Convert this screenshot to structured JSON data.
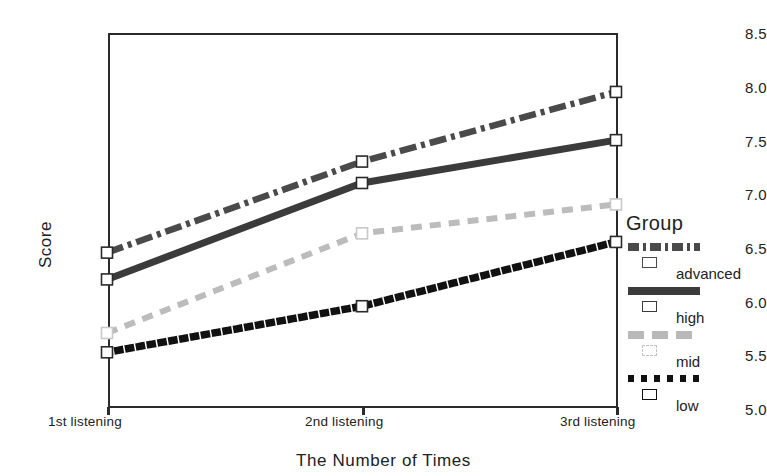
{
  "chart_data": {
    "type": "line",
    "title": "",
    "xlabel": "The Number of Times",
    "ylabel": "Score",
    "categories": [
      "1st listening",
      "2nd listening",
      "3rd listening"
    ],
    "ylim": [
      5.0,
      8.5
    ],
    "yticks": [
      "5.0",
      "5.5",
      "6.0",
      "6.5",
      "7.0",
      "7.5",
      "8.0",
      "8.5"
    ],
    "ytick_values": [
      5.0,
      5.5,
      6.0,
      6.5,
      7.0,
      7.5,
      8.0,
      8.5
    ],
    "grid": false,
    "legend_position": "right",
    "legend_title": "Group",
    "series": [
      {
        "name": "advanced",
        "values": [
          6.45,
          7.3,
          7.95
        ],
        "color": "#4a4a4a",
        "style": "dash-dot",
        "marker": "open-square"
      },
      {
        "name": "high",
        "values": [
          6.2,
          7.1,
          7.5
        ],
        "color": "#3b3b3b",
        "style": "solid",
        "marker": "open-square"
      },
      {
        "name": "mid",
        "values": [
          5.7,
          6.63,
          6.9
        ],
        "color": "#bcbcbc",
        "style": "dashed",
        "marker": "open-square"
      },
      {
        "name": "low",
        "values": [
          5.52,
          5.95,
          6.55
        ],
        "color": "#111111",
        "style": "dotted",
        "marker": "open-square"
      }
    ]
  },
  "axes": {
    "y_title": "Score",
    "x_title": "The Number of Times"
  },
  "legend": {
    "title": "Group",
    "entries": [
      {
        "label": "advanced"
      },
      {
        "label": "high"
      },
      {
        "label": "mid"
      },
      {
        "label": "low"
      }
    ]
  }
}
